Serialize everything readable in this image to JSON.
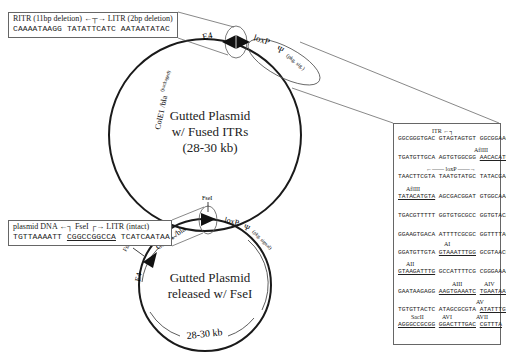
{
  "top_plasmid": {
    "title_lines": [
      "Gutted Plasmid",
      "w/ Fused ITRs",
      "(28-30 kb)"
    ],
    "labels": {
      "e4": "E4",
      "itr_itr": "ITR-ITR",
      "loxp": "loxP",
      "psi": "Ψ",
      "pkg_sig": "(pkg. sig.)",
      "cole1": "ColE1 /bla",
      "packaged": "(packaged)"
    },
    "junction_box": {
      "header_left": "RITR (11bp deletion)",
      "header_right": "LITR (2bp deletion)",
      "sequence": [
        "CAAAATAAGG",
        "TATATTCATC",
        "AATAATATAC"
      ]
    }
  },
  "bottom_plasmid": {
    "title_lines": [
      "Gutted Plasmid",
      "released w/ FseI"
    ],
    "size_label": "28-30 kb",
    "labels": {
      "fsei_top": "FseI",
      "fsei_left": "FseI",
      "e4": "E4",
      "cole1": "ColE1 /bla",
      "loxp": "loxP",
      "psi": "Ψ",
      "pkg_signal": "(pkg. signal)"
    },
    "junction_box": {
      "header_left": "plasmid DNA",
      "header_mid": "FseI",
      "header_right": "LITR (intact)",
      "sequence": [
        "TGTTAAAATT",
        "CGGCCGGCCA",
        "TCATCAATAA"
      ]
    }
  },
  "sequence_panel": {
    "rows": [
      {
        "label": "ITR",
        "cols": [
          "GGCGGGTGAC",
          "GTAGTAGTGT",
          "GGCGGAAGTG"
        ]
      },
      {
        "label": "AflIII",
        "cols": [
          "TGATGTTGCA",
          "AGTGTGGCGG",
          "AACACATGTA"
        ]
      },
      {
        "label": "loxP",
        "cols": [
          "TAACTTCGTA",
          "TAATGTATGC",
          "TATACGAAGT"
        ]
      },
      {
        "label": "AflIII",
        "cols": [
          "TATACATGTA",
          "AGCGACGGAT",
          "GTGGCAAAAG"
        ]
      },
      {
        "label": "",
        "cols": [
          "TGACGTTTTT",
          "GGTGTGCGCC",
          "GGTGTACACA"
        ]
      },
      {
        "label": "",
        "cols": [
          "GGAAGTGACA",
          "ATTTTCGCGC",
          "GGTTTTAGGC"
        ]
      },
      {
        "label": "AI",
        "cols": [
          "GGATGTTGTA",
          "GTAAATTTGG",
          "GCGTAACCGA"
        ]
      },
      {
        "label": "AII",
        "cols": [
          "GTAAGATTTG",
          "GCCATTTTCG",
          "CGGGAAAACT"
        ]
      },
      {
        "label": "AIII / AIV",
        "cols": [
          "GAATAAGAGG",
          "AAGTGAAATC",
          "TGAATAATTT"
        ]
      },
      {
        "label": "AV",
        "cols": [
          "TGTGTTACTC",
          "ATAGCGCGTA",
          "ATATTTGTCT"
        ]
      },
      {
        "label": "SacII / AVI / AVII",
        "cols": [
          "AGGGCCGCGG",
          "GGACTTTGAC",
          "CGTTTA"
        ]
      }
    ],
    "annotations": {
      "itr": "ITR",
      "afliii_1": "AflIII",
      "loxp": "loxP",
      "afliii_2": "AflIII",
      "ai": "AI",
      "aii": "AII",
      "aiii": "AIII",
      "aiv": "AIV",
      "av": "AV",
      "sacii": "SacII",
      "avi": "AVI",
      "avii": "AVII"
    }
  },
  "colors": {
    "line": "#1a1a1a",
    "box_border": "#666666",
    "text": "#222222"
  }
}
